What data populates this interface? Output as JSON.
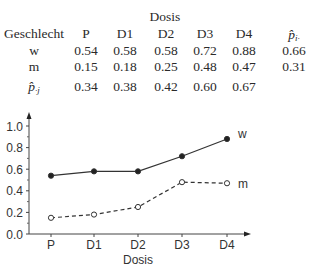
{
  "table": {
    "group_header": "Dosis",
    "row_header": "Geschlecht",
    "columns": [
      "P",
      "D1",
      "D2",
      "D3",
      "D4"
    ],
    "margin_row_label": "p̂",
    "margin_row_sub": "·j",
    "margin_col_label": "p̂",
    "margin_col_sub": "i·",
    "rows": [
      {
        "label": "w",
        "values": [
          "0.54",
          "0.58",
          "0.58",
          "0.72",
          "0.88"
        ],
        "margin": "0.66"
      },
      {
        "label": "m",
        "values": [
          "0.15",
          "0.18",
          "0.25",
          "0.48",
          "0.47"
        ],
        "margin": "0.31"
      }
    ],
    "col_margins": [
      "0.34",
      "0.38",
      "0.42",
      "0.60",
      "0.67"
    ]
  },
  "chart_data": {
    "type": "line",
    "title": "",
    "xlabel": "Dosis",
    "ylabel": "",
    "categories": [
      "P",
      "D1",
      "D2",
      "D3",
      "D4"
    ],
    "series": [
      {
        "name": "w",
        "values": [
          0.54,
          0.58,
          0.58,
          0.72,
          0.88
        ],
        "style": "solid",
        "marker": "filled-circle"
      },
      {
        "name": "m",
        "values": [
          0.15,
          0.18,
          0.25,
          0.48,
          0.47
        ],
        "style": "dashed",
        "marker": "open-circle"
      }
    ],
    "yticks": [
      "0.0",
      "0.2",
      "0.4",
      "0.6",
      "0.8",
      "1.0"
    ],
    "ylim": [
      0,
      1.0
    ],
    "grid": false,
    "legend_position": "inline-right"
  }
}
